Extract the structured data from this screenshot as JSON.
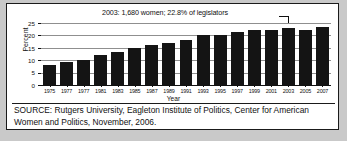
{
  "chart_data": {
    "type": "bar",
    "title": "",
    "xlabel": "Year",
    "ylabel": "Percent",
    "ylim": [
      0,
      25
    ],
    "yticks": [
      0,
      5,
      10,
      15,
      20,
      25
    ],
    "grid": true,
    "legend": null,
    "categories": [
      "1975",
      "1977",
      "1977",
      "1981",
      "1983",
      "1985",
      "1987",
      "1989",
      "1991",
      "1993",
      "1995",
      "1997",
      "1999",
      "2001",
      "2003",
      "2005",
      "2007"
    ],
    "values": [
      8.0,
      9.3,
      10.0,
      12.0,
      13.3,
      15.0,
      16.0,
      17.0,
      18.3,
      20.3,
      20.2,
      21.3,
      22.2,
      22.2,
      22.8,
      22.0,
      23.2
    ],
    "annotations": [
      {
        "text": "2003: 1,680 women; 22.8% of legislators",
        "target_category": "2003",
        "target_value": 22.8
      }
    ]
  },
  "source": {
    "text": "SOURCE: Rutgers University, Eagleton Institute of Politics, Center for American Women and Politics, November, 2006."
  },
  "colors": {
    "bar": "#141414",
    "grid": "#8f8f8f",
    "axis": "#111111",
    "figure_background": "#ffffff",
    "page_background": "#c9c9c9"
  }
}
